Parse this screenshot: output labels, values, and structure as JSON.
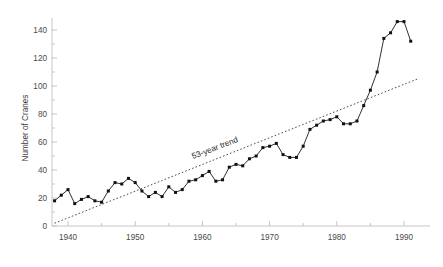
{
  "chart_data": {
    "type": "line",
    "title": "",
    "subtitle": "",
    "xlabel": "",
    "ylabel": "Number of Cranes",
    "xlim": [
      1937,
      1993
    ],
    "ylim": [
      0,
      150
    ],
    "grid": false,
    "legend_position": "none",
    "x_ticks": [
      1940,
      1950,
      1960,
      1970,
      1980,
      1990
    ],
    "x_tick_labels": [
      "1940",
      "1950",
      "1960",
      "1970",
      "1980",
      "1990"
    ],
    "x_minor_ticks": [
      1935,
      1945,
      1955,
      1965,
      1975,
      1985
    ],
    "y_ticks": [
      0,
      20,
      40,
      60,
      80,
      100,
      120,
      140
    ],
    "y_tick_labels": [
      "0",
      "20",
      "40",
      "60",
      "80",
      "100",
      "120",
      "140"
    ],
    "y_minor_ticks": [
      10,
      30,
      50,
      70,
      90,
      110,
      130
    ],
    "marker": "square",
    "marker_color": "#111111",
    "line_color": "#1a1a1a",
    "series": [
      {
        "name": "Number of Cranes",
        "style": "line-marker",
        "x": [
          1938,
          1939,
          1940,
          1941,
          1942,
          1943,
          1944,
          1945,
          1946,
          1947,
          1948,
          1949,
          1950,
          1951,
          1952,
          1953,
          1954,
          1955,
          1956,
          1957,
          1958,
          1959,
          1960,
          1961,
          1962,
          1963,
          1964,
          1965,
          1966,
          1967,
          1968,
          1969,
          1970,
          1971,
          1972,
          1973,
          1974,
          1975,
          1976,
          1977,
          1978,
          1979,
          1980,
          1981,
          1982,
          1983,
          1984,
          1985,
          1986,
          1987,
          1988,
          1989,
          1990,
          1991
        ],
        "values": [
          18,
          22,
          26,
          16,
          19,
          21,
          18,
          17,
          25,
          31,
          30,
          34,
          31,
          25,
          21,
          24,
          21,
          28,
          24,
          26,
          32,
          33,
          36,
          39,
          32,
          33,
          42,
          44,
          43,
          48,
          50,
          56,
          57,
          59,
          51,
          49,
          49,
          57,
          69,
          72,
          75,
          76,
          78,
          73,
          73,
          75,
          86,
          97,
          110,
          134,
          138,
          146,
          146,
          132
        ]
      }
    ],
    "trend": {
      "label": "53-year trend",
      "style": "dotted",
      "x": [
        1938,
        1992
      ],
      "values": [
        2,
        105
      ]
    },
    "annotations": [
      {
        "text": "53-year trend",
        "x": 1962,
        "y": 54,
        "rotation": -21
      }
    ]
  }
}
